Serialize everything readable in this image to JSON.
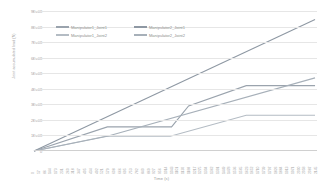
{
  "chart_data": {
    "type": "line",
    "title": "",
    "xlabel": "Time (s)",
    "ylabel": "Joint accumulated load (N)",
    "ylim": [
      0,
      900000000
    ],
    "xlim": [
      0,
      2160
    ],
    "grid": true,
    "legend_position": "top-inside",
    "y_ticks": [
      {
        "value": 0,
        "label": "0"
      },
      {
        "value": 100000000,
        "label": "1E+08"
      },
      {
        "value": 200000000,
        "label": "2E+08"
      },
      {
        "value": 300000000,
        "label": "3E+08"
      },
      {
        "value": 400000000,
        "label": "4E+08"
      },
      {
        "value": 500000000,
        "label": "5E+08"
      },
      {
        "value": 600000000,
        "label": "6E+08"
      },
      {
        "value": 700000000,
        "label": "7E+08"
      },
      {
        "value": 800000000,
        "label": "8E+08"
      },
      {
        "value": 900000000,
        "label": "9E+08"
      }
    ],
    "x_tick_labels": [
      "0",
      "57",
      "86",
      "144",
      "173",
      "231",
      "260",
      "318",
      "347",
      "405",
      "434",
      "492",
      "521",
      "579",
      "608",
      "666",
      "695",
      "753",
      "782",
      "840",
      "869",
      "927",
      "956",
      "1014",
      "1043",
      "1101",
      "1130",
      "1188",
      "1217",
      "1275",
      "1304",
      "1362",
      "1391",
      "1449",
      "1478",
      "1536",
      "1565",
      "1623",
      "1652",
      "1710",
      "1739",
      "1797",
      "1826",
      "1884",
      "1913",
      "1971",
      "2000",
      "2058",
      "2087",
      "2145"
    ],
    "series": [
      {
        "name": "Manipulator1_Joint1",
        "color": "#9aa3ad",
        "points": [
          {
            "x": 0,
            "y": 0
          },
          {
            "x": 560,
            "y": 155000000
          },
          {
            "x": 1050,
            "y": 155000000
          },
          {
            "x": 1180,
            "y": 290000000
          },
          {
            "x": 1620,
            "y": 420000000
          },
          {
            "x": 2145,
            "y": 420000000
          }
        ]
      },
      {
        "name": "Manipulator1_Joint2",
        "color": "#b4bcc4",
        "points": [
          {
            "x": 0,
            "y": 0
          },
          {
            "x": 550,
            "y": 95000000
          },
          {
            "x": 1040,
            "y": 95000000
          },
          {
            "x": 1620,
            "y": 230000000
          },
          {
            "x": 2145,
            "y": 230000000
          }
        ]
      },
      {
        "name": "Manipulator2_Joint1",
        "color": "#8e98a3",
        "points": [
          {
            "x": 0,
            "y": 0
          },
          {
            "x": 2145,
            "y": 845000000
          }
        ]
      },
      {
        "name": "Manipulator2_Joint2",
        "color": "#a7b0b9",
        "points": [
          {
            "x": 0,
            "y": 0
          },
          {
            "x": 560,
            "y": 95000000
          },
          {
            "x": 2145,
            "y": 470000000
          }
        ]
      }
    ]
  },
  "legend": {
    "entries": [
      {
        "label": "Manipulator1_Joint1"
      },
      {
        "label": "Manipulator1_Joint2"
      },
      {
        "label": "Manipulator2_Joint1"
      },
      {
        "label": "Manipulator2_Joint2"
      }
    ]
  }
}
